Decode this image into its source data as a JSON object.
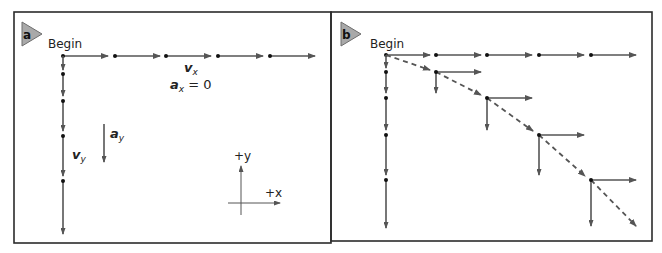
{
  "figure": {
    "colors": {
      "frame": "#2b2b2b",
      "vector": "#555555",
      "dot": "#111111",
      "badge": "#a9a9a9"
    },
    "panels": [
      {
        "id": "a",
        "badge": "a",
        "begin_label": "Begin",
        "labels": {
          "vx": "v",
          "vx_sub": "x",
          "ax": "a",
          "ax_sub": "x",
          "ax_eq": " = 0",
          "vy": "v",
          "vy_sub": "y",
          "ay": "a",
          "ay_sub": "y",
          "plus_y": "+y",
          "plus_x": "+x"
        },
        "description": "Horizontal motion: constant velocity vx (ax = 0). Vertical motion: velocity vy grows under acceleration ay."
      },
      {
        "id": "b",
        "badge": "b",
        "begin_label": "Begin",
        "description": "Combined projectile motion: velocity components at each time step, with dashed resultant path."
      }
    ]
  }
}
